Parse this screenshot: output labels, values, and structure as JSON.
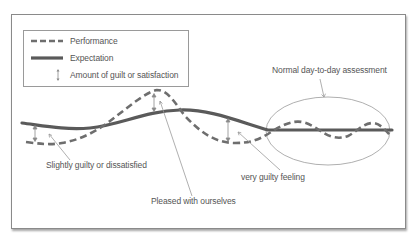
{
  "legend": {
    "items": [
      {
        "label": "Performance",
        "icon": "dashed-line-icon"
      },
      {
        "label": "Expectation",
        "icon": "solid-line-icon"
      },
      {
        "label": "Amount of guilt or satisfaction",
        "icon": "double-arrow-icon"
      }
    ]
  },
  "annotations": {
    "normal": "Normal day-to-day assessment",
    "slightly_guilty": "Slightly guilty or dissatisfied",
    "pleased": "Pleased with ourselves",
    "very_guilty": "very guilty feeling"
  },
  "colors": {
    "performance": "#6e6e6e",
    "expectation": "#5a5a5a",
    "leader": "#9a9a9a",
    "frame": "#8a8a8a"
  },
  "diagram": {
    "series": [
      {
        "name": "Performance",
        "style": "dashed"
      },
      {
        "name": "Expectation",
        "style": "solid"
      }
    ],
    "highlight": "Normal day-to-day assessment (oscillation around expectation)"
  }
}
